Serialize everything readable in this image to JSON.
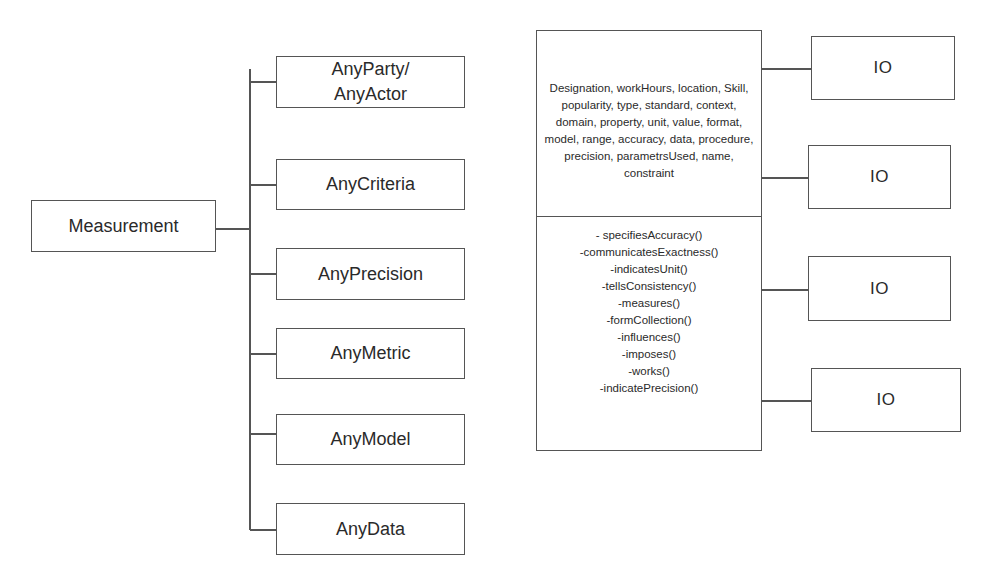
{
  "root": {
    "label": "Measurement"
  },
  "children": [
    {
      "label": "AnyParty/ AnyActor"
    },
    {
      "label": "AnyCriteria"
    },
    {
      "label": "AnyPrecision"
    },
    {
      "label": "AnyMetric"
    },
    {
      "label": "AnyModel"
    },
    {
      "label": "AnyData"
    }
  ],
  "class_box": {
    "attributes": "Designation, workHours, location, Skill, popularity, type, standard, context, domain, property, unit, value, format, model, range, accuracy, data, procedure, precision, parametrsUsed, name, constraint",
    "operations": [
      "- specifiesAccuracy()",
      "-communicatesExactness()",
      "-indicatesUnit()",
      "-tellsConsistency()",
      "-measures()",
      "-formCollection()",
      "-influences()",
      "-imposes()",
      "-works()",
      "-indicatePrecision()"
    ]
  },
  "io_boxes": [
    {
      "label": "IO"
    },
    {
      "label": "IO"
    },
    {
      "label": "IO"
    },
    {
      "label": "IO"
    }
  ]
}
